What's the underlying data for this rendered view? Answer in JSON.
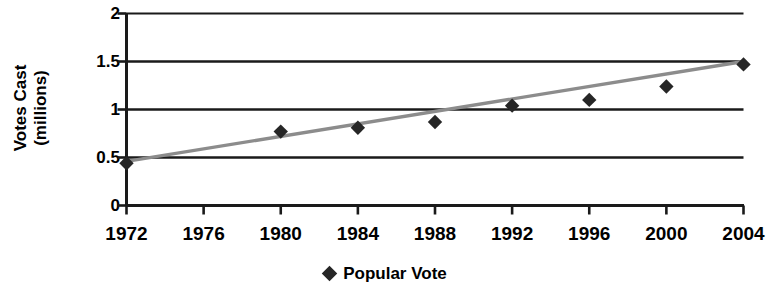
{
  "chart_data": {
    "type": "scatter",
    "title": "",
    "xlabel": "",
    "ylabel": "Votes Cast (millions)",
    "ylabel_line1": "Votes Cast",
    "ylabel_line2": "(millions)",
    "categories": [
      "1972",
      "1976",
      "1980",
      "1984",
      "1988",
      "1992",
      "1996",
      "2000",
      "2004"
    ],
    "x": [
      1972,
      1976,
      1980,
      1984,
      1988,
      1992,
      1996,
      2000,
      2004
    ],
    "series": [
      {
        "name": "Popular Vote",
        "marker": "diamond",
        "color": "#262626",
        "values": [
          0.44,
          null,
          0.77,
          0.81,
          0.87,
          1.04,
          1.1,
          1.24,
          1.47
        ]
      }
    ],
    "trendline": {
      "name": "linear trend",
      "color": "#8c8c8c",
      "start": {
        "x": 1972,
        "y": 0.46
      },
      "end": {
        "x": 2004,
        "y": 1.5
      }
    },
    "xlim": [
      1972,
      2004
    ],
    "ylim": [
      0,
      2
    ],
    "yticks": [
      "0",
      "0.5",
      "1",
      "1.5",
      "2"
    ],
    "ytick_values": [
      0,
      0.5,
      1,
      1.5,
      2
    ],
    "xticks": [
      "1972",
      "1976",
      "1980",
      "1984",
      "1988",
      "1992",
      "1996",
      "2000",
      "2004"
    ],
    "grid": true,
    "grid_axis": "y",
    "legend": {
      "position": "bottom",
      "entries": [
        {
          "label": "Popular Vote",
          "marker": "diamond",
          "color": "#262626"
        }
      ]
    },
    "colors": {
      "axis": "#1a1a1a",
      "grid": "#1a1a1a",
      "marker": "#262626",
      "trendline": "#8c8c8c",
      "background": "#ffffff"
    }
  },
  "axes": {
    "y_title_line1": "Votes Cast",
    "y_title_line2": "(millions)"
  },
  "legend": {
    "entry_label": "Popular Vote"
  }
}
